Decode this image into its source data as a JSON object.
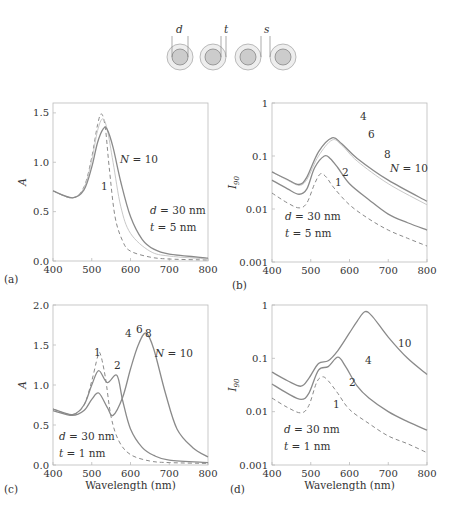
{
  "schematic": {
    "labels": [
      "d",
      "t",
      "s"
    ],
    "circles": 4
  },
  "panel_labels": [
    "(a)",
    "(b)",
    "(c)",
    "(d)"
  ],
  "chart_data": [
    {
      "id": "a",
      "type": "line",
      "title": "",
      "xlabel": "",
      "ylabel": "A",
      "xlim": [
        400,
        800
      ],
      "ylim": [
        0.0,
        1.6
      ],
      "xticks": [
        "400",
        "500",
        "600",
        "700",
        "800"
      ],
      "yticks": [
        "0.0",
        "0.5",
        "1.0",
        "1.5"
      ],
      "annotations": [
        "N = 10",
        "1",
        "d = 30 nm",
        "t = 5 nm"
      ],
      "series": [
        {
          "name": "N = 1",
          "style": "dashed",
          "x": [
            400,
            450,
            480,
            500,
            515,
            525,
            535,
            545,
            560,
            580,
            600,
            650,
            700,
            800
          ],
          "values": [
            0.71,
            0.64,
            0.75,
            1.05,
            1.38,
            1.49,
            1.35,
            0.95,
            0.45,
            0.2,
            0.1,
            0.04,
            0.02,
            0.01
          ]
        },
        {
          "name": "N = 2",
          "style": "solid-light",
          "x": [
            400,
            450,
            480,
            500,
            515,
            528,
            540,
            555,
            575,
            600,
            650,
            700,
            800
          ],
          "values": [
            0.71,
            0.64,
            0.74,
            1.02,
            1.32,
            1.44,
            1.33,
            1.0,
            0.55,
            0.28,
            0.1,
            0.05,
            0.02
          ]
        },
        {
          "name": "N = 10",
          "style": "solid",
          "x": [
            400,
            450,
            480,
            500,
            515,
            530,
            540,
            555,
            575,
            600,
            630,
            660,
            700,
            800
          ],
          "values": [
            0.71,
            0.64,
            0.72,
            0.95,
            1.2,
            1.34,
            1.33,
            1.15,
            0.8,
            0.45,
            0.22,
            0.12,
            0.07,
            0.03
          ]
        }
      ]
    },
    {
      "id": "b",
      "type": "line",
      "yscale": "log",
      "xlabel": "",
      "ylabel": "I90",
      "xlim": [
        400,
        800
      ],
      "ylim": [
        0.001,
        1
      ],
      "xticks": [
        "400",
        "500",
        "600",
        "700",
        "800"
      ],
      "yticks": [
        "0.001",
        "0.01",
        "0.1",
        "1"
      ],
      "annotations": [
        "4",
        "6",
        "8",
        "N = 10",
        "2",
        "1",
        "d = 30 nm",
        "t = 5 nm"
      ],
      "series": [
        {
          "name": "N = 1",
          "style": "dashed",
          "x": [
            400,
            440,
            470,
            490,
            510,
            525,
            540,
            560,
            600,
            650,
            700,
            750,
            800
          ],
          "values": [
            0.02,
            0.013,
            0.0105,
            0.013,
            0.03,
            0.046,
            0.04,
            0.025,
            0.012,
            0.0065,
            0.004,
            0.0028,
            0.002
          ]
        },
        {
          "name": "N = 2",
          "style": "solid",
          "x": [
            400,
            440,
            470,
            490,
            510,
            535,
            550,
            570,
            600,
            650,
            700,
            750,
            800
          ],
          "values": [
            0.035,
            0.024,
            0.019,
            0.024,
            0.06,
            0.1,
            0.09,
            0.06,
            0.03,
            0.015,
            0.008,
            0.0055,
            0.004
          ]
        },
        {
          "name": "N = 4",
          "style": "solid-light",
          "x": [
            400,
            440,
            470,
            490,
            520,
            555,
            580,
            620,
            700,
            800
          ],
          "values": [
            0.05,
            0.035,
            0.028,
            0.036,
            0.1,
            0.2,
            0.16,
            0.08,
            0.03,
            0.012
          ]
        },
        {
          "name": "N = 10",
          "style": "solid",
          "x": [
            400,
            440,
            470,
            490,
            520,
            555,
            580,
            620,
            700,
            800
          ],
          "values": [
            0.05,
            0.036,
            0.029,
            0.04,
            0.12,
            0.22,
            0.17,
            0.09,
            0.035,
            0.014
          ]
        }
      ]
    },
    {
      "id": "c",
      "type": "line",
      "xlabel": "Wavelength (nm)",
      "ylabel": "A",
      "xlim": [
        400,
        800
      ],
      "ylim": [
        0.0,
        2.0
      ],
      "xticks": [
        "400",
        "500",
        "600",
        "700",
        "800"
      ],
      "yticks": [
        "0.0",
        "0.5",
        "1.0",
        "1.5",
        "2.0"
      ],
      "annotations": [
        "1",
        "2",
        "4",
        "6",
        "8",
        "N = 10",
        "d = 30 nm",
        "t = 1 nm"
      ],
      "series": [
        {
          "name": "N = 1",
          "style": "dashed",
          "x": [
            400,
            450,
            480,
            500,
            515,
            522,
            535,
            550,
            570,
            600,
            650,
            700,
            800
          ],
          "values": [
            0.7,
            0.63,
            0.75,
            1.05,
            1.35,
            1.39,
            1.1,
            0.6,
            0.3,
            0.13,
            0.05,
            0.03,
            0.02
          ]
        },
        {
          "name": "N = 2",
          "style": "solid",
          "x": [
            400,
            450,
            480,
            500,
            518,
            540,
            565,
            580,
            600,
            630,
            660,
            700,
            800
          ],
          "values": [
            0.7,
            0.63,
            0.75,
            1.0,
            1.18,
            1.03,
            1.12,
            0.8,
            0.45,
            0.22,
            0.12,
            0.06,
            0.03
          ]
        },
        {
          "name": "N = 10",
          "style": "solid",
          "x": [
            400,
            450,
            480,
            500,
            518,
            540,
            555,
            580,
            600,
            620,
            640,
            660,
            690,
            720,
            760,
            800
          ],
          "values": [
            0.68,
            0.62,
            0.68,
            0.82,
            0.9,
            0.72,
            0.62,
            0.85,
            1.2,
            1.5,
            1.65,
            1.45,
            0.9,
            0.45,
            0.22,
            0.1
          ]
        }
      ]
    },
    {
      "id": "d",
      "type": "line",
      "yscale": "log",
      "xlabel": "Wavelength (nm)",
      "ylabel": "I90",
      "xlim": [
        400,
        800
      ],
      "ylim": [
        0.001,
        1
      ],
      "xticks": [
        "400",
        "500",
        "600",
        "700",
        "800"
      ],
      "yticks": [
        "0.001",
        "0.01",
        "0.1",
        "1"
      ],
      "annotations": [
        "10",
        "4",
        "2",
        "1",
        "d = 30 nm",
        "t = 1 nm"
      ],
      "series": [
        {
          "name": "N = 1",
          "style": "dashed",
          "x": [
            400,
            440,
            475,
            495,
            515,
            530,
            545,
            570,
            600,
            650,
            700,
            750,
            800
          ],
          "values": [
            0.018,
            0.012,
            0.0095,
            0.013,
            0.035,
            0.045,
            0.038,
            0.022,
            0.011,
            0.006,
            0.0035,
            0.0025,
            0.0017
          ]
        },
        {
          "name": "N = 2",
          "style": "solid",
          "x": [
            400,
            440,
            475,
            495,
            520,
            545,
            570,
            590,
            620,
            650,
            700,
            750,
            800
          ],
          "values": [
            0.033,
            0.022,
            0.017,
            0.022,
            0.06,
            0.07,
            0.105,
            0.07,
            0.03,
            0.018,
            0.01,
            0.0065,
            0.0045
          ]
        },
        {
          "name": "N = 10",
          "style": "solid",
          "x": [
            400,
            440,
            475,
            495,
            520,
            545,
            570,
            600,
            620,
            640,
            660,
            700,
            750,
            800
          ],
          "values": [
            0.055,
            0.038,
            0.03,
            0.042,
            0.08,
            0.09,
            0.14,
            0.3,
            0.5,
            0.75,
            0.6,
            0.25,
            0.1,
            0.05
          ]
        }
      ]
    }
  ]
}
